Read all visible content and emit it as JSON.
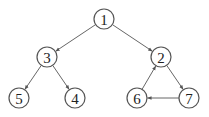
{
  "diagram": {
    "type": "directed-graph",
    "nodes": [
      {
        "id": "1",
        "label": "1",
        "x": 104,
        "y": 19
      },
      {
        "id": "3",
        "label": "3",
        "x": 47,
        "y": 57
      },
      {
        "id": "2",
        "label": "2",
        "x": 161,
        "y": 57
      },
      {
        "id": "5",
        "label": "5",
        "x": 19,
        "y": 98
      },
      {
        "id": "4",
        "label": "4",
        "x": 75,
        "y": 98
      },
      {
        "id": "6",
        "label": "6",
        "x": 137,
        "y": 98
      },
      {
        "id": "7",
        "label": "7",
        "x": 189,
        "y": 98
      }
    ],
    "edges": [
      {
        "from": "1",
        "to": "3"
      },
      {
        "from": "1",
        "to": "2"
      },
      {
        "from": "3",
        "to": "5"
      },
      {
        "from": "3",
        "to": "4"
      },
      {
        "from": "2",
        "to": "7"
      },
      {
        "from": "7",
        "to": "6"
      },
      {
        "from": "6",
        "to": "2"
      }
    ],
    "node_radius": 10,
    "colors": {
      "stroke": "#555555",
      "fill": "#ffffff",
      "text": "#222222"
    }
  }
}
